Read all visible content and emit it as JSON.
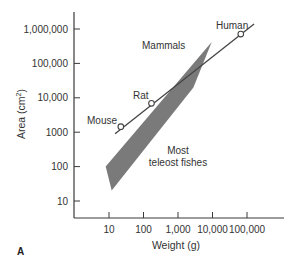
{
  "chart_data": {
    "type": "line",
    "title": "",
    "panel_label": "A",
    "xlabel": "Weight (g)",
    "ylabel": "Area (cm²)",
    "xscale": "log",
    "yscale": "log",
    "xlim": [
      4,
      300000
    ],
    "ylim": [
      2,
      3000000
    ],
    "grid": false,
    "x_ticks": [
      10,
      100,
      1000,
      10000,
      100000
    ],
    "x_tick_labels": [
      "10",
      "100",
      "1,000",
      "10,000",
      "100,000"
    ],
    "y_ticks": [
      10,
      100,
      1000,
      10000,
      100000,
      1000000
    ],
    "y_tick_labels": [
      "10",
      "100",
      "1000",
      "10,000",
      "100,000",
      "1,000,000"
    ],
    "series": [
      {
        "name": "Mammals",
        "kind": "line-with-points",
        "line_start": {
          "x": 15,
          "y": 900
        },
        "line_end": {
          "x": 160000,
          "y": 1400000
        },
        "points": [
          {
            "label": "Mouse",
            "x": 22,
            "y": 1450
          },
          {
            "label": "Rat",
            "x": 170,
            "y": 6900
          },
          {
            "label": "Human",
            "x": 66000,
            "y": 710000
          }
        ]
      },
      {
        "name": "Most teleost fishes",
        "kind": "shaded-region",
        "color": "#7a7a7a",
        "polygon": [
          {
            "x": 8,
            "y": 100
          },
          {
            "x": 9500,
            "y": 420000
          },
          {
            "x": 2800,
            "y": 20000
          },
          {
            "x": 12,
            "y": 20
          }
        ]
      }
    ],
    "annotations": [
      {
        "text": "Mammals",
        "x": 1000,
        "y": 200000
      },
      {
        "text": "Most teleost fishes",
        "x": 2200,
        "y": 200
      }
    ]
  },
  "labels": {
    "mammals": "Mammals",
    "fish_line1": "Most",
    "fish_line2": "teleost fishes",
    "mouse": "Mouse",
    "rat": "Rat",
    "human": "Human",
    "panel": "A",
    "xlabel": "Weight (g)",
    "ylabel_main": "Area (cm",
    "ylabel_sup": "2",
    "ylabel_end": ")"
  },
  "colors": {
    "axis": "#3a3a3a",
    "line": "#444444",
    "region": "#7a7a7a",
    "text": "#333333"
  }
}
